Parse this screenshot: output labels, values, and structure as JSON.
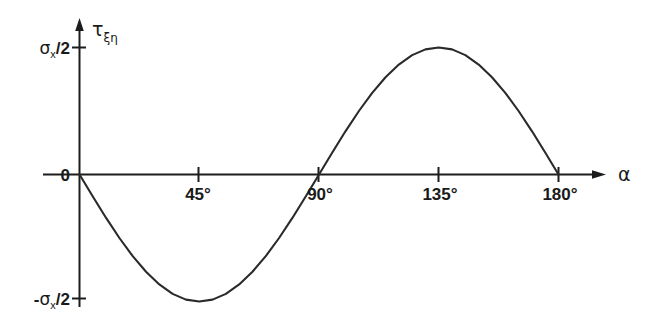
{
  "chart_data": {
    "type": "line",
    "title": "",
    "subtitle": "",
    "xlabel": "α",
    "ylabel": "τ",
    "ylabel_sub": "ξη",
    "xlim": [
      0,
      180
    ],
    "ylim": [
      -1,
      1
    ],
    "grid": false,
    "legend": null,
    "equation": "τ = -(σx/2)·sin(2α)",
    "x_tick_labels": [
      "45°",
      "90°",
      "135°",
      "180°"
    ],
    "x_tick_values": [
      45,
      90,
      135,
      180
    ],
    "y_tick_labels": [
      "σ",
      "0",
      "-σ"
    ],
    "y_axis_top_label": {
      "symbol": "σ",
      "subscript": "x",
      "suffix": "/2",
      "value": 1
    },
    "y_axis_zero_label": {
      "text": "0",
      "value": 0
    },
    "y_axis_bottom_label": {
      "prefix": "-",
      "symbol": "σ",
      "subscript": "x",
      "suffix": "/2",
      "value": -1
    },
    "series": [
      {
        "name": "tau_xi_eta",
        "x": [
          0,
          5,
          10,
          15,
          20,
          25,
          30,
          35,
          40,
          45,
          50,
          55,
          60,
          65,
          70,
          75,
          80,
          85,
          90,
          95,
          100,
          105,
          110,
          115,
          120,
          125,
          130,
          135,
          140,
          145,
          150,
          155,
          160,
          165,
          170,
          175,
          180
        ],
        "values": [
          0,
          -0.1736,
          -0.342,
          -0.5,
          -0.643,
          -0.766,
          -0.866,
          -0.94,
          -0.985,
          -1.0,
          -0.985,
          -0.94,
          -0.866,
          -0.766,
          -0.643,
          -0.5,
          -0.342,
          -0.1736,
          0,
          0.1736,
          0.342,
          0.5,
          0.643,
          0.766,
          0.866,
          0.94,
          0.985,
          1.0,
          0.985,
          0.94,
          0.866,
          0.766,
          0.643,
          0.5,
          0.342,
          0.1736,
          0
        ]
      }
    ],
    "annotations": [
      {
        "name": "minimum",
        "x": 45,
        "y": -1
      },
      {
        "name": "zero-crossing",
        "x": 90,
        "y": 0
      },
      {
        "name": "maximum",
        "x": 135,
        "y": 1
      },
      {
        "name": "end-zero",
        "x": 180,
        "y": 0
      }
    ],
    "colors": {
      "curve": "#2a2a2a",
      "axis": "#1c1c1c",
      "background": "#ffffff",
      "text": "#1a1a1a"
    }
  }
}
